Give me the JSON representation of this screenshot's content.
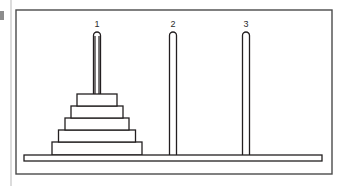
{
  "figure": {
    "background_color": "#ffffff",
    "ink_color": "#231f20",
    "label_color": "#2b2b2b",
    "frame": {
      "name": "figure-border",
      "x": 16,
      "y": 10,
      "width": 316,
      "height": 164,
      "stroke_width": 1.4,
      "color": "#4a4a4a"
    },
    "page_edge": {
      "name": "page-gutter-line",
      "x": 11,
      "y_top": 0,
      "y_bottom": 186,
      "color": "#b9b9b9",
      "stroke_width": 1
    },
    "margin_mark": {
      "name": "page-margin-artifact",
      "x": 0,
      "y": 11,
      "width": 4,
      "height": 9,
      "color": "#8c8c8c"
    },
    "base": {
      "name": "base-bar",
      "x": 24,
      "y": 155,
      "width": 298,
      "height": 6,
      "fill": "#ffffff",
      "stroke": "#231f20",
      "stroke_width": 1.3
    },
    "pegs": [
      {
        "id": "peg-1",
        "label": "1",
        "center_x": 97,
        "top_y": 32,
        "bottom_y": 156,
        "width": 7,
        "label_x": 97,
        "label_y": 27,
        "disk_count": 5
      },
      {
        "id": "peg-2",
        "label": "2",
        "center_x": 173,
        "top_y": 32,
        "bottom_y": 156,
        "width": 7,
        "label_x": 173,
        "label_y": 27,
        "disk_count": 0
      },
      {
        "id": "peg-3",
        "label": "3",
        "center_x": 246,
        "top_y": 32,
        "bottom_y": 156,
        "width": 7,
        "label_x": 246,
        "label_y": 27,
        "disk_count": 0
      }
    ],
    "disks": [
      {
        "id": "disk-1",
        "size_rank": 1,
        "peg": "peg-1",
        "center_x": 97,
        "y": 94,
        "width": 40,
        "height": 12,
        "fill": "#ffffff",
        "stroke": "#231f20",
        "stroke_width": 1.3
      },
      {
        "id": "disk-2",
        "size_rank": 2,
        "peg": "peg-1",
        "center_x": 97,
        "y": 106,
        "width": 52,
        "height": 12,
        "fill": "#ffffff",
        "stroke": "#231f20",
        "stroke_width": 1.3
      },
      {
        "id": "disk-3",
        "size_rank": 3,
        "peg": "peg-1",
        "center_x": 97,
        "y": 118,
        "width": 64,
        "height": 12,
        "fill": "#ffffff",
        "stroke": "#231f20",
        "stroke_width": 1.3
      },
      {
        "id": "disk-4",
        "size_rank": 4,
        "peg": "peg-1",
        "center_x": 97,
        "y": 130,
        "width": 77,
        "height": 12,
        "fill": "#ffffff",
        "stroke": "#231f20",
        "stroke_width": 1.3
      },
      {
        "id": "disk-5",
        "size_rank": 5,
        "peg": "peg-1",
        "center_x": 97,
        "y": 142,
        "width": 90,
        "height": 13,
        "fill": "#ffffff",
        "stroke": "#231f20",
        "stroke_width": 1.3
      }
    ]
  }
}
